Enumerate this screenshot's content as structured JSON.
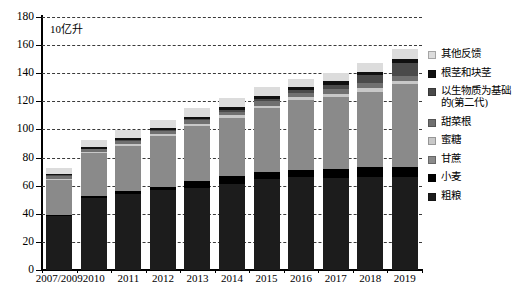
{
  "chart_data": {
    "type": "bar",
    "stacked": true,
    "title": "",
    "unit_label": "10亿升",
    "xlabel": "",
    "ylabel": "",
    "ylim": [
      0,
      180
    ],
    "yticks": [
      0,
      20,
      40,
      60,
      80,
      100,
      120,
      140,
      160,
      180
    ],
    "grid": true,
    "legend_position": "right",
    "categories": [
      "2007/2009",
      "2010",
      "2011",
      "2012",
      "2013",
      "2014",
      "2015",
      "2016",
      "2017",
      "2018",
      "2019"
    ],
    "series": [
      {
        "name": "粗粮",
        "color": "#1c1c1c",
        "values": [
          38.5,
          51.0,
          54.0,
          57.0,
          58.5,
          61.5,
          64.5,
          66.0,
          65.5,
          66.0,
          66.5
        ]
      },
      {
        "name": "小麦",
        "color": "#000000",
        "values": [
          1.0,
          1.5,
          2.0,
          2.0,
          4.5,
          5.5,
          5.0,
          5.5,
          6.5,
          7.0,
          7.0
        ]
      },
      {
        "name": "甘蔗",
        "color": "#8a8a8a",
        "values": [
          24.5,
          30.5,
          32.5,
          36.5,
          39.5,
          41.5,
          45.5,
          49.5,
          51.0,
          54.0,
          58.5
        ]
      },
      {
        "name": "蜜糖",
        "color": "#c8c8c8",
        "values": [
          1.0,
          1.0,
          1.5,
          1.5,
          1.5,
          1.5,
          2.0,
          2.0,
          2.5,
          2.5,
          2.5
        ]
      },
      {
        "name": "甜菜根",
        "color": "#707070",
        "values": [
          2.0,
          2.0,
          2.0,
          2.0,
          2.5,
          2.5,
          3.0,
          3.0,
          3.5,
          3.5,
          3.5
        ]
      },
      {
        "name": "以生物质为基础\n的(第二代)",
        "color": "#4a4a4a",
        "values": [
          0.5,
          0.5,
          0.5,
          0.5,
          1.0,
          1.5,
          2.0,
          2.0,
          3.0,
          5.5,
          9.5
        ]
      },
      {
        "name": "根茎和块茎",
        "color": "#101010",
        "values": [
          1.0,
          1.0,
          1.5,
          1.5,
          1.5,
          2.0,
          2.0,
          2.5,
          2.5,
          2.5,
          3.0
        ]
      },
      {
        "name": "其他反馈",
        "color": "#dcdcdc",
        "values": [
          4.5,
          5.0,
          5.5,
          6.0,
          6.0,
          6.5,
          6.5,
          5.5,
          6.0,
          6.5,
          7.0
        ]
      }
    ],
    "totals": [
      73.0,
      92.5,
      99.5,
      107.0,
      115.0,
      122.5,
      130.5,
      136.0,
      140.5,
      147.5,
      157.5
    ]
  },
  "legend": {
    "items": [
      {
        "label": "其他反馈",
        "color": "#dcdcdc"
      },
      {
        "label": "根茎和块茎",
        "color": "#101010"
      },
      {
        "label": "以生物质为基础\n的(第二代)",
        "color": "#4a4a4a"
      },
      {
        "label": "甜菜根",
        "color": "#707070"
      },
      {
        "label": "蜜糖",
        "color": "#c8c8c8"
      },
      {
        "label": "甘蔗",
        "color": "#8a8a8a"
      },
      {
        "label": "小麦",
        "color": "#000000"
      },
      {
        "label": "粗粮",
        "color": "#1c1c1c"
      }
    ]
  }
}
